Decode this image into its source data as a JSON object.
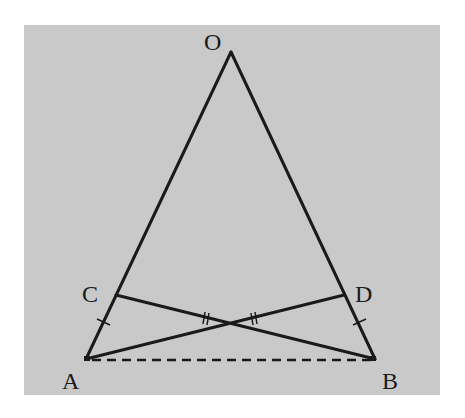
{
  "diagram": {
    "background_color": "#c9c9c9",
    "line_color": "#1a1a1a",
    "points": {
      "O": {
        "label": "O",
        "x": 231,
        "y": 52
      },
      "A": {
        "label": "A",
        "x": 86,
        "y": 359
      },
      "B": {
        "label": "B",
        "x": 375,
        "y": 359
      },
      "C": {
        "label": "C",
        "x": 116,
        "y": 295
      },
      "D": {
        "label": "D",
        "x": 344,
        "y": 295
      }
    },
    "segments": [
      {
        "name": "OA",
        "from": "O",
        "to": "A",
        "style": "solid"
      },
      {
        "name": "OB",
        "from": "O",
        "to": "B",
        "style": "solid"
      },
      {
        "name": "CB",
        "from": "C",
        "to": "B",
        "style": "solid"
      },
      {
        "name": "DA",
        "from": "D",
        "to": "A",
        "style": "solid"
      },
      {
        "name": "AB",
        "from": "A",
        "to": "B",
        "style": "dashed"
      }
    ],
    "congruence_marks": [
      {
        "segment": "AC",
        "ticks": 1
      },
      {
        "segment": "BD",
        "ticks": 1
      },
      {
        "segment": "C-intersection",
        "ticks": 2
      },
      {
        "segment": "D-intersection",
        "ticks": 2
      }
    ],
    "labels": {
      "O": "O",
      "A": "A",
      "B": "B",
      "C": "C",
      "D": "D"
    }
  }
}
